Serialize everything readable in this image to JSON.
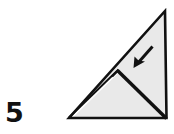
{
  "figure": {
    "step_number": "5",
    "background_color": "#ffffff"
  },
  "colors": {
    "paper_fill": "#e9e9e9",
    "outline": "#111111",
    "sliver_fill": "#ffffff",
    "number_color": "#111111"
  },
  "geometry": {
    "outer_triangle": {
      "name": "outer-right-triangle",
      "vertices": [
        {
          "label": "apex-top-right",
          "x": 165,
          "y": 10
        },
        {
          "label": "corner-bottom-right",
          "x": 167,
          "y": 119
        },
        {
          "label": "corner-bottom-left",
          "x": 68,
          "y": 119
        }
      ],
      "outline_width": 2.6
    },
    "hypotenuse_sliver": {
      "name": "flap-edge-sliver",
      "from": {
        "x": 70,
        "y": 117
      },
      "to": {
        "x": 118,
        "y": 70
      },
      "note": "thin white gap between raised flap edge and layer beneath"
    },
    "inner_fold": {
      "name": "inner-fold-crease",
      "peak": {
        "x": 118,
        "y": 70
      },
      "end": {
        "x": 166,
        "y": 118
      },
      "stroke_width": 3.4
    },
    "arrow": {
      "name": "fold-direction-arrow",
      "direction": "southwest",
      "tail": {
        "x": 153,
        "y": 46
      },
      "tip": {
        "x": 134,
        "y": 67
      },
      "stroke_width": 3.0
    }
  },
  "labels": {
    "step": "5"
  }
}
